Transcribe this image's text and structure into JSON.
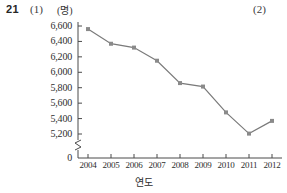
{
  "header": {
    "item_number": "21",
    "part_one": "(1)",
    "part_two": "(2)"
  },
  "chart_data": {
    "type": "line",
    "title": "",
    "unit_label": "(명)",
    "xlabel": "연도",
    "ylabel": "",
    "categories": [
      "2004",
      "2005",
      "2006",
      "2007",
      "2008",
      "2009",
      "2010",
      "2011",
      "2012"
    ],
    "values": [
      6560,
      6370,
      6320,
      6150,
      5860,
      5815,
      5480,
      5205,
      5370
    ],
    "ytick_labels": [
      "6,600",
      "6,400",
      "6,200",
      "6,000",
      "5,800",
      "5,600",
      "5,400",
      "5,200",
      "0"
    ],
    "ytick_values": [
      6600,
      6400,
      6200,
      6000,
      5800,
      5600,
      5400,
      5200,
      0
    ],
    "ylim": [
      5200,
      6600
    ],
    "axis_break": true,
    "grid": false,
    "legend": "none",
    "line_color": "#7a7a7a",
    "marker_color": "#8a8a8a",
    "axis_color": "#4a4a4a"
  }
}
